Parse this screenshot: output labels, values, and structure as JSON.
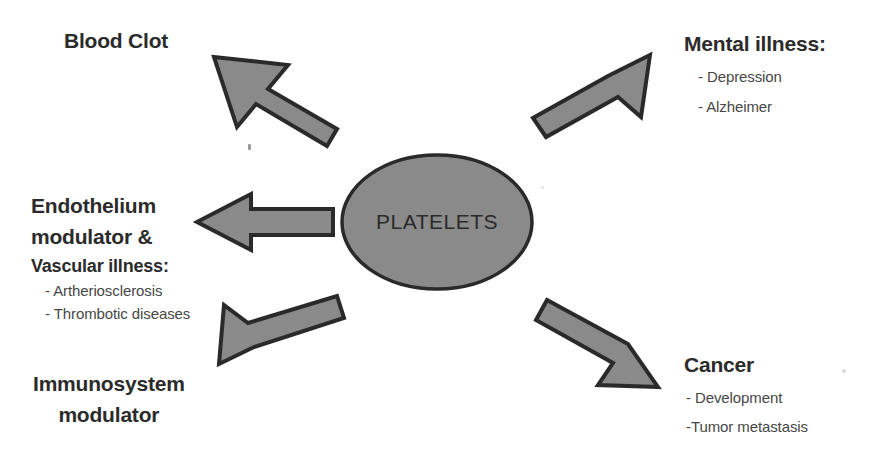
{
  "diagram": {
    "center": {
      "label": "PLATELETS",
      "shape": "ellipse"
    },
    "colors": {
      "shape_fill": "#8a8a8a",
      "shape_stroke": "#2a2a2a",
      "heading_text": "#2b2b2b",
      "subitem_text": "#474747",
      "background": "#ffffff"
    },
    "branches": [
      {
        "id": "blood-clot",
        "heading": "Blood Clot",
        "arrow": "arrow-up-left",
        "items": []
      },
      {
        "id": "endothelium",
        "heading_line1": "Endothelium",
        "heading_line2": "modulator &",
        "heading_line3": "Vascular illness:",
        "arrow": "arrow-left",
        "items": [
          "-  Artheriosclerosis",
          "-  Thrombotic diseases"
        ]
      },
      {
        "id": "immunosystem",
        "heading_line1": "Immunosystem",
        "heading_line2": "modulator",
        "arrow": "arrow-down-left",
        "items": []
      },
      {
        "id": "mental-illness",
        "heading": "Mental illness:",
        "arrow": "arrow-up-right",
        "items": [
          "-  Depression",
          "-  Alzheimer"
        ]
      },
      {
        "id": "cancer",
        "heading": "Cancer",
        "arrow": "arrow-down-right",
        "items": [
          "- Development",
          "-Tumor metastasis"
        ]
      }
    ]
  }
}
